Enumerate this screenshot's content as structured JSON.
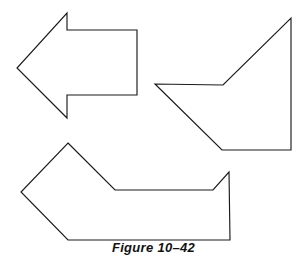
{
  "figure": {
    "caption": "Figure 10–42",
    "background_color": "#ffffff",
    "stroke_color": "#1a1a1a",
    "stroke_width": 1.15,
    "canvas": {
      "width": 307,
      "height": 262
    },
    "shapes": [
      {
        "name": "left-arrow-polygon",
        "label": "left-pointing arrow",
        "closed": true,
        "points": "67,13 67,30 137,30 137,95 67,95 67,118 17,68"
      },
      {
        "name": "right-notched-polygon",
        "label": "notched quadrilateral with concave step",
        "closed": true,
        "points": "291,18 291,150 222,150 155,84 223,85"
      },
      {
        "name": "bottom-channel-polygon",
        "label": "U-shaped channel with arrow tail",
        "closed": true,
        "points": "68,143 115,190 213,190 229,172 230,240 68,240 21,192"
      }
    ]
  }
}
